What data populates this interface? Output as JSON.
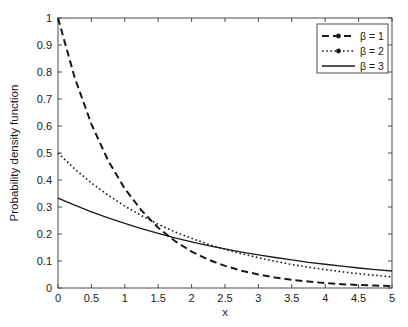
{
  "chart_data": {
    "type": "line",
    "title": "",
    "xlabel": "x",
    "ylabel": "Probability density function",
    "xlim": [
      0,
      5
    ],
    "ylim": [
      0,
      1
    ],
    "grid": false,
    "legend_position": "top-right",
    "xticks": [
      "0",
      "0.5",
      "1",
      "1.5",
      "2",
      "2.5",
      "3",
      "3.5",
      "4",
      "4.5",
      "5"
    ],
    "xtick_values": [
      0,
      0.5,
      1,
      1.5,
      2,
      2.5,
      3,
      3.5,
      4,
      4.5,
      5
    ],
    "yticks": [
      "0",
      "0.1",
      "0.2",
      "0.3",
      "0.4",
      "0.5",
      "0.6",
      "0.7",
      "0.8",
      "0.9",
      "1"
    ],
    "ytick_values": [
      0,
      0.1,
      0.2,
      0.3,
      0.4,
      0.5,
      0.6,
      0.7,
      0.8,
      0.9,
      1
    ],
    "x": [
      0,
      0.25,
      0.5,
      0.75,
      1,
      1.25,
      1.5,
      1.75,
      2,
      2.25,
      2.5,
      2.75,
      3,
      3.25,
      3.5,
      3.75,
      4,
      4.25,
      4.5,
      4.75,
      5
    ],
    "series": [
      {
        "name": "β = 1",
        "legend_label": "β = 1",
        "style": "dashed",
        "color": "#1a1a1a",
        "values": [
          1.0,
          0.779,
          0.607,
          0.472,
          0.368,
          0.287,
          0.223,
          0.174,
          0.135,
          0.105,
          0.082,
          0.064,
          0.05,
          0.039,
          0.03,
          0.024,
          0.018,
          0.014,
          0.011,
          0.009,
          0.007
        ]
      },
      {
        "name": "β = 2",
        "legend_label": "β = 2",
        "style": "dotted",
        "color": "#1a1a1a",
        "values": [
          0.5,
          0.441,
          0.389,
          0.344,
          0.303,
          0.268,
          0.236,
          0.208,
          0.184,
          0.162,
          0.143,
          0.127,
          0.112,
          0.099,
          0.087,
          0.077,
          0.068,
          0.06,
          0.053,
          0.047,
          0.041
        ]
      },
      {
        "name": "β = 3",
        "legend_label": "β = 3",
        "style": "solid",
        "color": "#1a1a1a",
        "values": [
          0.333,
          0.307,
          0.282,
          0.26,
          0.239,
          0.22,
          0.202,
          0.186,
          0.171,
          0.157,
          0.145,
          0.133,
          0.123,
          0.113,
          0.104,
          0.095,
          0.088,
          0.081,
          0.074,
          0.068,
          0.063
        ]
      }
    ]
  }
}
